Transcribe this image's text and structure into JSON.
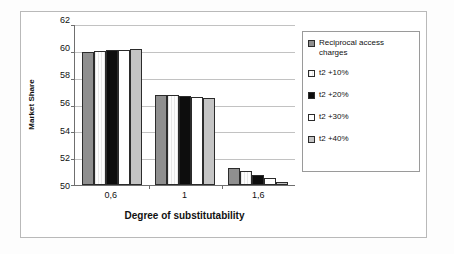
{
  "chart_data": {
    "type": "bar",
    "title": "",
    "xlabel": "Degree of substitutability",
    "ylabel": "Market Share",
    "categories": [
      "0,6",
      "1",
      "1,6"
    ],
    "ylim": [
      50,
      62
    ],
    "yticks": [
      50,
      52,
      54,
      56,
      58,
      60,
      62
    ],
    "grid": true,
    "legend_position": "right",
    "series": [
      {
        "name": "Reciprocal access charges",
        "values": [
          60.0,
          56.75,
          51.3
        ],
        "fill": "medium-gray-dotted"
      },
      {
        "name": "t2 +10%",
        "values": [
          60.05,
          56.72,
          51.05
        ],
        "fill": "white-vertical-hatch"
      },
      {
        "name": "t2 +20%",
        "values": [
          60.12,
          56.68,
          50.75
        ],
        "fill": "solid-black"
      },
      {
        "name": "t2 +30%",
        "values": [
          60.15,
          56.63,
          50.5
        ],
        "fill": "white"
      },
      {
        "name": "t2 +40%",
        "values": [
          60.2,
          56.55,
          50.25
        ],
        "fill": "light-gray-dotted"
      }
    ]
  },
  "axis": {
    "y_title": "Market Share",
    "x_title": "Degree of substitutability",
    "y_tick_labels": [
      "62",
      "60",
      "58",
      "56",
      "54",
      "52",
      "50"
    ],
    "x_tick_labels": [
      "0,6",
      "1",
      "1,6"
    ]
  },
  "legend": {
    "items": [
      {
        "label": "Reciprocal access charges"
      },
      {
        "label": "t2 +10%"
      },
      {
        "label": "t2 +20%"
      },
      {
        "label": "t2 +30%"
      },
      {
        "label": "t2 +40%"
      }
    ]
  },
  "colors": {
    "axis": "#6f6f6f",
    "grid": "#c2c2c2",
    "frame": "#b9b9b9",
    "series_medium_gray": "#8f8f8f",
    "series_black": "#0d0d0d",
    "series_white": "#ffffff",
    "series_light_gray": "#c4c4c4",
    "text": "#111111"
  }
}
